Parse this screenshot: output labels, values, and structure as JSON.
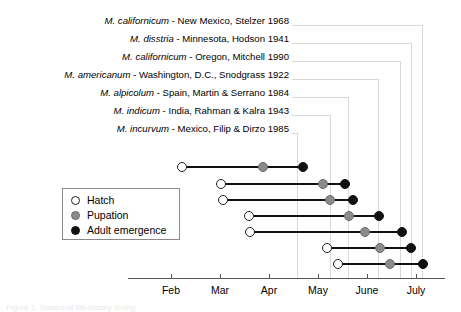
{
  "figure": {
    "caption_fragment": "Figure 1.  Seasonal life-history timing"
  },
  "taxa": [
    {
      "species": "M. californicum",
      "rest": " - New Mexico, Stelzer 1968"
    },
    {
      "species": "M. disstria",
      "rest": " - Minnesota, Hodson 1941"
    },
    {
      "species": "M. californicum",
      "rest": " - Oregon, Mitchell 1990"
    },
    {
      "species": "M. americanum",
      "rest": " - Washington, D.C., Snodgrass 1922"
    },
    {
      "species": "M. alpicolum",
      "rest": " - Spain, Martin & Serrano 1984"
    },
    {
      "species": "M. indicum",
      "rest": " - India, Rahman & Kalra 1943"
    },
    {
      "species": "M. incurvum",
      "rest": " - Mexico, Filip & Dirzo 1985"
    }
  ],
  "legend": {
    "items": [
      {
        "label": "Hatch",
        "marker": "open-circle",
        "color": "#ffffff"
      },
      {
        "label": "Pupation",
        "marker": "gray-circle",
        "color": "#8c8c8c"
      },
      {
        "label": "Adult emergence",
        "marker": "filled-circle",
        "color": "#111111"
      }
    ]
  },
  "axis": {
    "ticks": [
      "Feb",
      "Mar",
      "Apr",
      "May",
      "June",
      "July"
    ]
  },
  "chart_data": {
    "type": "line",
    "title": "",
    "xlabel": "",
    "ylabel": "",
    "x_tick_labels": [
      "Feb",
      "Mar",
      "Apr",
      "May",
      "June",
      "July"
    ],
    "x_tick_px": [
      171,
      220,
      269,
      318,
      367,
      416
    ],
    "grid": false,
    "legend_position": "inside-left",
    "stage_names": [
      "Hatch",
      "Pupation",
      "Adult emergence"
    ],
    "categories": [
      "M. californicum - New Mexico, Stelzer 1968",
      "M. disstria - Minnesota, Hodson 1941",
      "M. californicum - Oregon, Mitchell 1990",
      "M. americanum - Washington, D.C., Snodgrass 1922",
      "M. alpicolum - Spain, Martin & Serrano 1984",
      "M. indicum - India, Rahman & Kalra 1943",
      "M. incurvum - Mexico, Filip & Dirzo 1985"
    ],
    "series": [
      {
        "name": "Hatch",
        "values_px": [
          182,
          221,
          223,
          249,
          250,
          327,
          338
        ]
      },
      {
        "name": "Pupation",
        "values_px": [
          263,
          323,
          330,
          349,
          365,
          380,
          390
        ]
      },
      {
        "name": "Adult emergence",
        "values_px": [
          303,
          345,
          353,
          379,
          402,
          411,
          423
        ]
      }
    ],
    "rows_y_px": [
      167,
      184,
      200,
      216,
      232,
      248,
      264
    ]
  },
  "brackets": {
    "verticals_px": [
      422,
      411,
      400,
      378,
      348,
      330,
      297
    ],
    "label_right_px": 289
  }
}
